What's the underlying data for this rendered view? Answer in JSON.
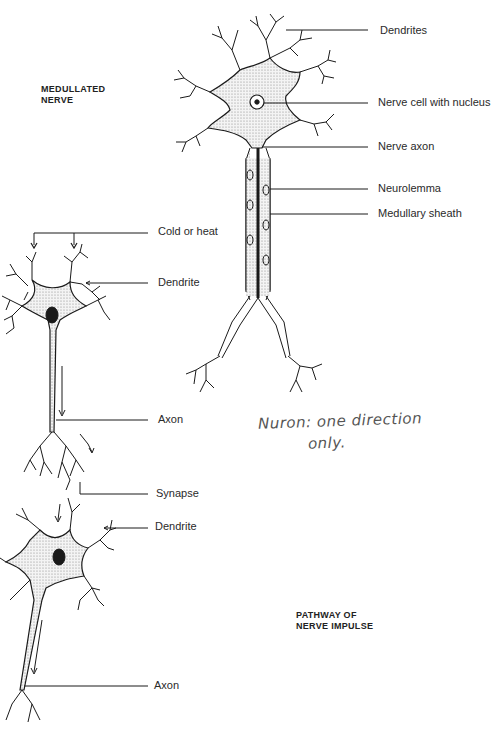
{
  "headings": {
    "medullated": [
      "MEDULLATED",
      "NERVE"
    ],
    "pathway": [
      "PATHWAY OF",
      "NERVE IMPULSE"
    ]
  },
  "medullated_labels": [
    {
      "id": "dendrites",
      "text": "Dendrites"
    },
    {
      "id": "nerve-cell",
      "text": "Nerve cell with nucleus"
    },
    {
      "id": "nerve-axon",
      "text": "Nerve axon"
    },
    {
      "id": "neurolemma",
      "text": "Neurolemma"
    },
    {
      "id": "medullary-sheath",
      "text": "Medullary sheath"
    }
  ],
  "pathway_labels": [
    {
      "id": "cold-heat",
      "text": "Cold or heat"
    },
    {
      "id": "dendrite-1",
      "text": "Dendrite"
    },
    {
      "id": "axon-1",
      "text": "Axon"
    },
    {
      "id": "synapse",
      "text": "Synapse"
    },
    {
      "id": "dendrite-2",
      "text": "Dendrite"
    },
    {
      "id": "axon-2",
      "text": "Axon"
    }
  ],
  "handwritten_note": {
    "line1": "Nuron: one direction",
    "line2": "only."
  },
  "colors": {
    "ink": "#1a1a1a",
    "stipple": "#cfcfcf",
    "pencil": "#555555"
  }
}
